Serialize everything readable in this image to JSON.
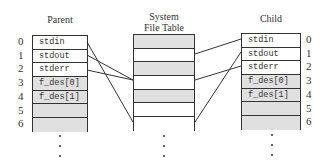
{
  "parent": {
    "title": "Parent",
    "rows": [
      {
        "index": "0",
        "label": "stdin",
        "shaded": false
      },
      {
        "index": "1",
        "label": "stdout",
        "shaded": false
      },
      {
        "index": "2",
        "label": "stderr",
        "shaded": false
      },
      {
        "index": "3",
        "label": "f_des[0]",
        "shaded": true
      },
      {
        "index": "4",
        "label": "f_des[1]",
        "shaded": true
      },
      {
        "index": "5",
        "label": "",
        "shaded": true
      },
      {
        "index": "6",
        "label": "",
        "shaded": true
      }
    ]
  },
  "system_file_table": {
    "title_line1": "System",
    "title_line2": "File Table",
    "rows": [
      {
        "shaded": true
      },
      {
        "shaded": false
      },
      {
        "shaded": true
      },
      {
        "shaded": false
      },
      {
        "shaded": true
      },
      {
        "shaded": false
      },
      {
        "shaded": false
      }
    ]
  },
  "child": {
    "title": "Child",
    "rows": [
      {
        "index": "0",
        "label": "stdin",
        "shaded": false
      },
      {
        "index": "1",
        "label": "stdout",
        "shaded": false
      },
      {
        "index": "2",
        "label": "stderr",
        "shaded": false
      },
      {
        "index": "3",
        "label": "f_des[0]",
        "shaded": true
      },
      {
        "index": "4",
        "label": "f_des[1]",
        "shaded": true
      },
      {
        "index": "5",
        "label": "",
        "shaded": true
      },
      {
        "index": "6",
        "label": "",
        "shaded": true
      }
    ]
  },
  "connections": [
    {
      "from": "parent.stdin",
      "to": "system_file_table.row6"
    },
    {
      "from": "parent.stdout",
      "to": "system_file_table.row3"
    },
    {
      "from": "parent.stderr",
      "to": "system_file_table.row3"
    },
    {
      "from": "child.stdin",
      "to": "system_file_table.row1"
    },
    {
      "from": "child.stdout",
      "to": "system_file_table.row6"
    },
    {
      "from": "child.stderr",
      "to": "system_file_table.row3"
    }
  ],
  "colors": {
    "shade": "#e0e0e0",
    "line": "#333333"
  }
}
